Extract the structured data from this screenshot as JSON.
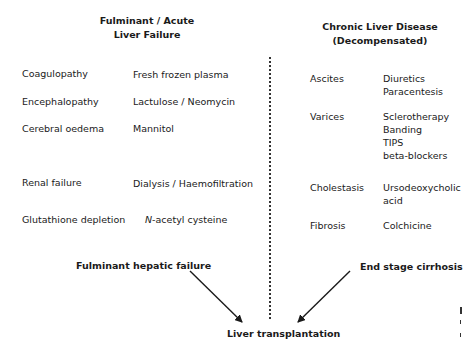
{
  "left": {
    "title_line1": "Fulminant / Acute",
    "title_line2": "Liver Failure",
    "rows": [
      {
        "problem": "Coagulopathy",
        "treatment": "Fresh frozen plasma"
      },
      {
        "problem": "Encephalopathy",
        "treatment": "Lactulose / Neomycin"
      },
      {
        "problem": "Cerebral oedema",
        "treatment": "Mannitol"
      },
      {
        "problem": "Renal failure",
        "treatment": "Dialysis / Haemofiltration"
      },
      {
        "problem": "Glutathione depletion",
        "treatment_italic": "N",
        "treatment": "-acetyl cysteine"
      }
    ],
    "endpoint": "Fulminant hepatic failure"
  },
  "right": {
    "title_line1": "Chronic Liver Disease",
    "title_line2": "(Decompensated)",
    "rows": [
      {
        "problem": "Ascites",
        "treatments": [
          "Diuretics",
          "Paracentesis"
        ]
      },
      {
        "problem": "Varices",
        "treatments": [
          "Sclerotherapy",
          "Banding",
          "TIPS",
          "beta-blockers"
        ]
      },
      {
        "problem": "Cholestasis",
        "treatments": [
          "Ursodeoxycholic",
          "acid"
        ]
      },
      {
        "problem": "Fibrosis",
        "treatments": [
          "Colchicine"
        ]
      }
    ],
    "endpoint": "End stage cirrhosis"
  },
  "outcome": "Liver transplantation",
  "colors": {
    "text": "#1a1a1a",
    "line": "#333333",
    "background": "#ffffff"
  }
}
